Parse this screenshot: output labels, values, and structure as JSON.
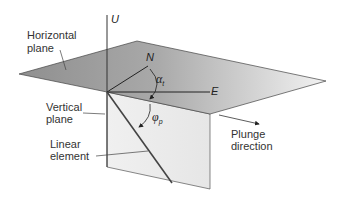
{
  "diagram": {
    "axes": {
      "up": "U",
      "north": "N",
      "east": "E"
    },
    "angles": {
      "trend": {
        "symbol": "α",
        "subscript": "t"
      },
      "plunge": {
        "symbol": "φ",
        "subscript": "p"
      }
    },
    "labels": {
      "horizontal_plane": [
        "Horizontal",
        "plane"
      ],
      "vertical_plane": [
        "Vertical",
        "plane"
      ],
      "linear_element": [
        "Linear",
        "element"
      ],
      "plunge_direction": [
        "Plunge",
        "direction"
      ]
    },
    "colors": {
      "horizontal_plane_dark": "#8f8f8f",
      "horizontal_plane_light": "#ededed",
      "vertical_plane": "#ececec",
      "lines": "#333333"
    }
  }
}
